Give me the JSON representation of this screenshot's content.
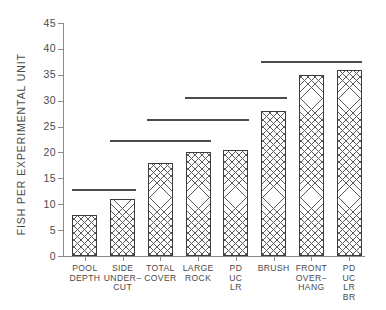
{
  "chart_data": {
    "type": "bar",
    "title": "",
    "subtitle": "",
    "xlabel": "",
    "ylabel": "FISH PER EXPERIMENTAL UNIT",
    "ylim": [
      0,
      45
    ],
    "yticks": [
      0,
      5,
      10,
      15,
      20,
      25,
      30,
      35,
      40,
      45
    ],
    "ytick_labels": [
      "0",
      "5",
      "10",
      "15",
      "20",
      "25",
      "30",
      "35",
      "40",
      "45"
    ],
    "grid": false,
    "legend": null,
    "categories": [
      "POOL\nDEPTH",
      "SIDE\nUNDER−\nCUT",
      "TOTAL\nCOVER",
      "LARGE\nROCK",
      "PD\nUC\nLR",
      "BRUSH",
      "FRONT\nOVER−\nHANG",
      "PD\nUC\nLR\nBR"
    ],
    "values": [
      8,
      11,
      18,
      20,
      20.5,
      28,
      35,
      36
    ],
    "annotations": [
      {
        "name": "significance-line-1",
        "value": 13,
        "start_category": 0,
        "end_category": 1
      },
      {
        "name": "significance-line-2",
        "value": 22.5,
        "start_category": 1,
        "end_category": 3
      },
      {
        "name": "significance-line-3",
        "value": 26.5,
        "start_category": 2,
        "end_category": 4
      },
      {
        "name": "significance-line-4",
        "value": 30.8,
        "start_category": 3,
        "end_category": 5
      },
      {
        "name": "significance-line-5",
        "value": 37.6,
        "start_category": 5,
        "end_category": 7
      }
    ],
    "bar_style": {
      "fill": "crosshatch",
      "edge_color": "#3c3c3c",
      "face_color": "#ffffff",
      "hatch_color": "#5b5b5b"
    },
    "axis_color": "#8a8a8a",
    "text_color": "#4a4a4a"
  }
}
